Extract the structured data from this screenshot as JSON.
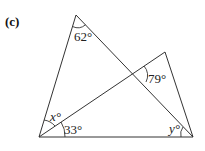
{
  "figure": {
    "part_label": "(c)",
    "angles": {
      "top": "62°",
      "intersection": "79°",
      "bottom_left_upper": "x°",
      "bottom_left_lower": "33°",
      "bottom_right": "y°"
    }
  }
}
